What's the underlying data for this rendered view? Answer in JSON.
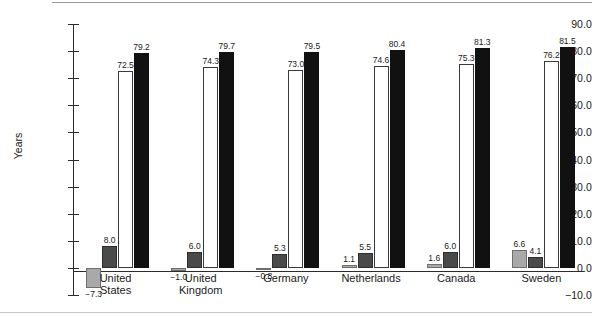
{
  "axis": {
    "ylabel": "Years",
    "yticks": [
      "90.0",
      "80.0",
      "70.0",
      "60.0",
      "50.0",
      "40.0",
      "30.0",
      "20.0",
      "10.0",
      "0.0",
      "-10.0"
    ]
  },
  "chart_data": {
    "type": "bar",
    "title": "",
    "xlabel": "",
    "ylabel": "Years",
    "ylim": [
      -10.0,
      90.0
    ],
    "ytick_step": 10.0,
    "grid": false,
    "legend": "none",
    "categories": [
      "United\nStates",
      "United\nKingdom",
      "Germany",
      "Netherlands",
      "Canada",
      "Sweden"
    ],
    "series": [
      {
        "name": "light-gray",
        "color": "#a9a9a9",
        "values": [
          -7.3,
          -1.0,
          -0.8,
          1.1,
          1.6,
          6.6
        ]
      },
      {
        "name": "dark-gray",
        "color": "#4a4a4a",
        "values": [
          8.0,
          6.0,
          5.3,
          5.5,
          6.0,
          4.1
        ]
      },
      {
        "name": "white",
        "color": "#ffffff",
        "values": [
          72.5,
          74.3,
          73.0,
          74.6,
          75.3,
          76.2
        ]
      },
      {
        "name": "black",
        "color": "#111111",
        "values": [
          79.2,
          79.7,
          79.5,
          80.4,
          81.3,
          81.5
        ]
      }
    ],
    "data_labels": {
      "light-gray": [
        "-7.3",
        "-1.0",
        "-0.8",
        "1.1",
        "1.6",
        "6.6"
      ],
      "dark-gray": [
        "8.0",
        "6.0",
        "5.3",
        "5.5",
        "6.0",
        "4.1"
      ],
      "white": [
        "72.5",
        "74.3",
        "73.0",
        "74.6",
        "75.3",
        "76.2"
      ],
      "black": [
        "79.2",
        "79.7",
        "79.5",
        "80.4",
        "81.3",
        "81.5"
      ]
    }
  }
}
